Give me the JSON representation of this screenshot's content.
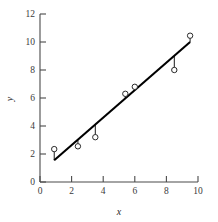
{
  "chart_data": {
    "type": "scatter",
    "title": "",
    "xlabel": "x",
    "ylabel": "y",
    "xlim": [
      0,
      10
    ],
    "ylim": [
      0,
      12
    ],
    "xticks": [
      0,
      2,
      4,
      6,
      8,
      10
    ],
    "yticks": [
      0,
      2,
      4,
      6,
      8,
      10,
      12
    ],
    "xtick_labels": [
      "0",
      "2",
      "4",
      "6",
      "8",
      "10"
    ],
    "ytick_labels": [
      "0",
      "2",
      "4",
      "6",
      "8",
      "10",
      "12"
    ],
    "grid": false,
    "legend": null,
    "series": [
      {
        "name": "observations",
        "marker": "open-circle",
        "x": [
          0.9,
          2.4,
          3.5,
          5.4,
          6.0,
          8.5,
          9.5
        ],
        "y": [
          2.35,
          2.55,
          3.2,
          6.3,
          6.8,
          8.0,
          10.45
        ]
      }
    ],
    "fit_line": {
      "name": "least-squares fit",
      "x": [
        0.9,
        9.5
      ],
      "y": [
        1.55,
        10.0
      ],
      "slope": 0.98,
      "intercept": 0.67
    },
    "residuals": {
      "name": "residual segments",
      "segments": [
        {
          "x": 0.9,
          "y_point": 2.35,
          "y_line": 1.55
        },
        {
          "x": 2.4,
          "y_point": 2.55,
          "y_line": 3.02
        },
        {
          "x": 3.5,
          "y_point": 3.2,
          "y_line": 4.1
        },
        {
          "x": 5.4,
          "y_point": 6.3,
          "y_line": 5.96
        },
        {
          "x": 6.0,
          "y_point": 6.8,
          "y_line": 6.55
        },
        {
          "x": 8.5,
          "y_point": 8.0,
          "y_line": 9.0
        },
        {
          "x": 9.5,
          "y_point": 10.45,
          "y_line": 10.0
        }
      ]
    },
    "colors": {
      "line": "#000000",
      "marker_stroke": "#2a2a2a",
      "marker_fill": "#ffffff",
      "axis": "#4a4a4a",
      "text": "#3a3a3a",
      "background": "#ffffff"
    }
  }
}
